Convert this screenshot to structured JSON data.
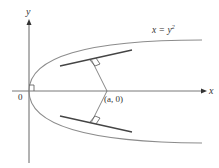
{
  "diagram": {
    "type": "parabola-normal-lines",
    "labels": {
      "y_axis": "y",
      "x_axis": "x",
      "origin": "0",
      "point": "(a, 0)",
      "curve_lhs": "x = y",
      "curve_exp": "2"
    },
    "colors": {
      "axis": "#555555",
      "curve": "#8a8a8a",
      "tangent": "#444444",
      "normal": "#666666",
      "background": "#ffffff"
    }
  }
}
